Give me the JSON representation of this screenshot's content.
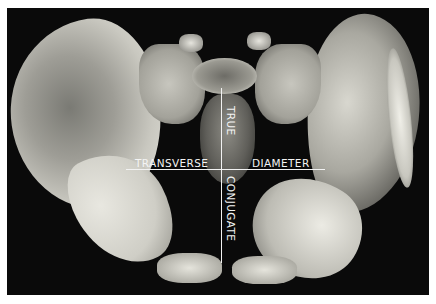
{
  "figure": {
    "labels": {
      "transverse": "TRANSVERSE",
      "diameter": "DIAMETER",
      "true": "TRUE",
      "conjugate": "CONJUGATE"
    },
    "colors": {
      "background": "#0a0a0a",
      "border": "#ffffff",
      "label_text": "#f4f4f4",
      "measurement_line": "#f2f2f2"
    }
  }
}
